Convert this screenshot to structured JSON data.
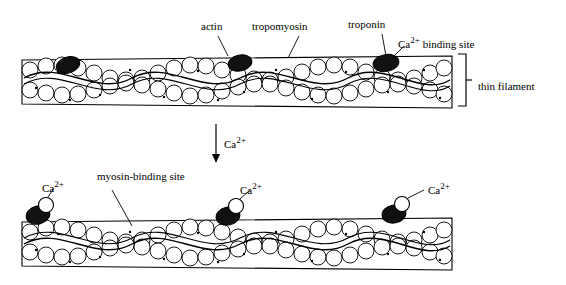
{
  "figure": {
    "type": "biology-diagram",
    "labels": {
      "actin": "actin",
      "tropomyosin": "tropomyosin",
      "troponin": "troponin",
      "ca_binding_site": "Ca2+ binding site",
      "thin_filament": "thin filament",
      "ca_arrow": "Ca2+",
      "myosin_binding_site": "myosin-binding site",
      "ca_1": "Ca2+",
      "ca_2": "Ca2+",
      "ca_3": "Ca2+"
    },
    "colors": {
      "outline": "#000000",
      "fill": "#ffffff",
      "troponin_dark": "#1a1a1a",
      "calcium_ion": "#ffffff"
    }
  }
}
